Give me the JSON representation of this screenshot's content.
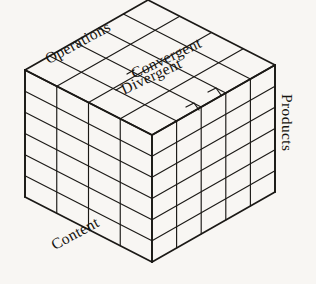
{
  "figure": {
    "name": "structure-of-intellect-cube",
    "background_color": "#f8f6f3",
    "line_color": "#1b1916",
    "text_color": "#16140f"
  },
  "labels": {
    "operations": "Operations",
    "convergent": "Convergent",
    "divergent": "Divergent",
    "products": "Products",
    "content": "Content"
  },
  "chart_data": {
    "type": "diagram",
    "title": "",
    "dimensions": [
      {
        "axis": "Operations",
        "label": "Operations",
        "cells": 5,
        "edge": "top-left-receding"
      },
      {
        "axis": "Content",
        "label": "Content",
        "cells": 4,
        "edge": "bottom-left-receding"
      },
      {
        "axis": "Products",
        "label": "Products",
        "cells": 6,
        "edge": "right-vertical"
      }
    ],
    "callouts": [
      {
        "label": "Convergent",
        "points_to": "top-face-operations-slice-2"
      },
      {
        "label": "Divergent",
        "points_to": "top-face-operations-slice-3"
      }
    ],
    "faces": {
      "front_left": {
        "columns": 4,
        "rows": 6,
        "axes": [
          "Content",
          "Products"
        ]
      },
      "front_right": {
        "columns": 5,
        "rows": 6,
        "axes": [
          "Operations",
          "Products"
        ]
      },
      "top": {
        "columns": 5,
        "rows": 4,
        "axes": [
          "Operations",
          "Content"
        ]
      }
    },
    "total_cells": 120
  }
}
